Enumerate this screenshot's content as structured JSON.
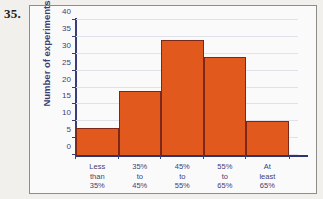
{
  "problem": {
    "number": "35."
  },
  "chart_data": {
    "type": "bar",
    "title": "",
    "xlabel": "",
    "ylabel": "Number of experiments",
    "categories": [
      "Less\nthan\n35%",
      "35%\nto\n45%",
      "45%\nto\n55%",
      "55%\nto\n65%",
      "At\nleast\n65%"
    ],
    "category_lines": [
      [
        "Less",
        "than",
        "35%"
      ],
      [
        "35%",
        "to",
        "45%"
      ],
      [
        "45%",
        "to",
        "55%"
      ],
      [
        "55%",
        "to",
        "65%"
      ],
      [
        "At",
        "least",
        "65%"
      ]
    ],
    "values": [
      8,
      19,
      34,
      29,
      10
    ],
    "ylim": [
      0,
      40
    ],
    "ytick_step": 5,
    "yticks": [
      0,
      5,
      10,
      15,
      20,
      25,
      30,
      35,
      40
    ],
    "grid": true,
    "legend": null,
    "bar_color": "#e2591e",
    "bar_edge_color": "#7d2718",
    "axis_color": "#3b3f78",
    "grid_color": "#dfe2ea",
    "text_color": "#3b3f78"
  }
}
